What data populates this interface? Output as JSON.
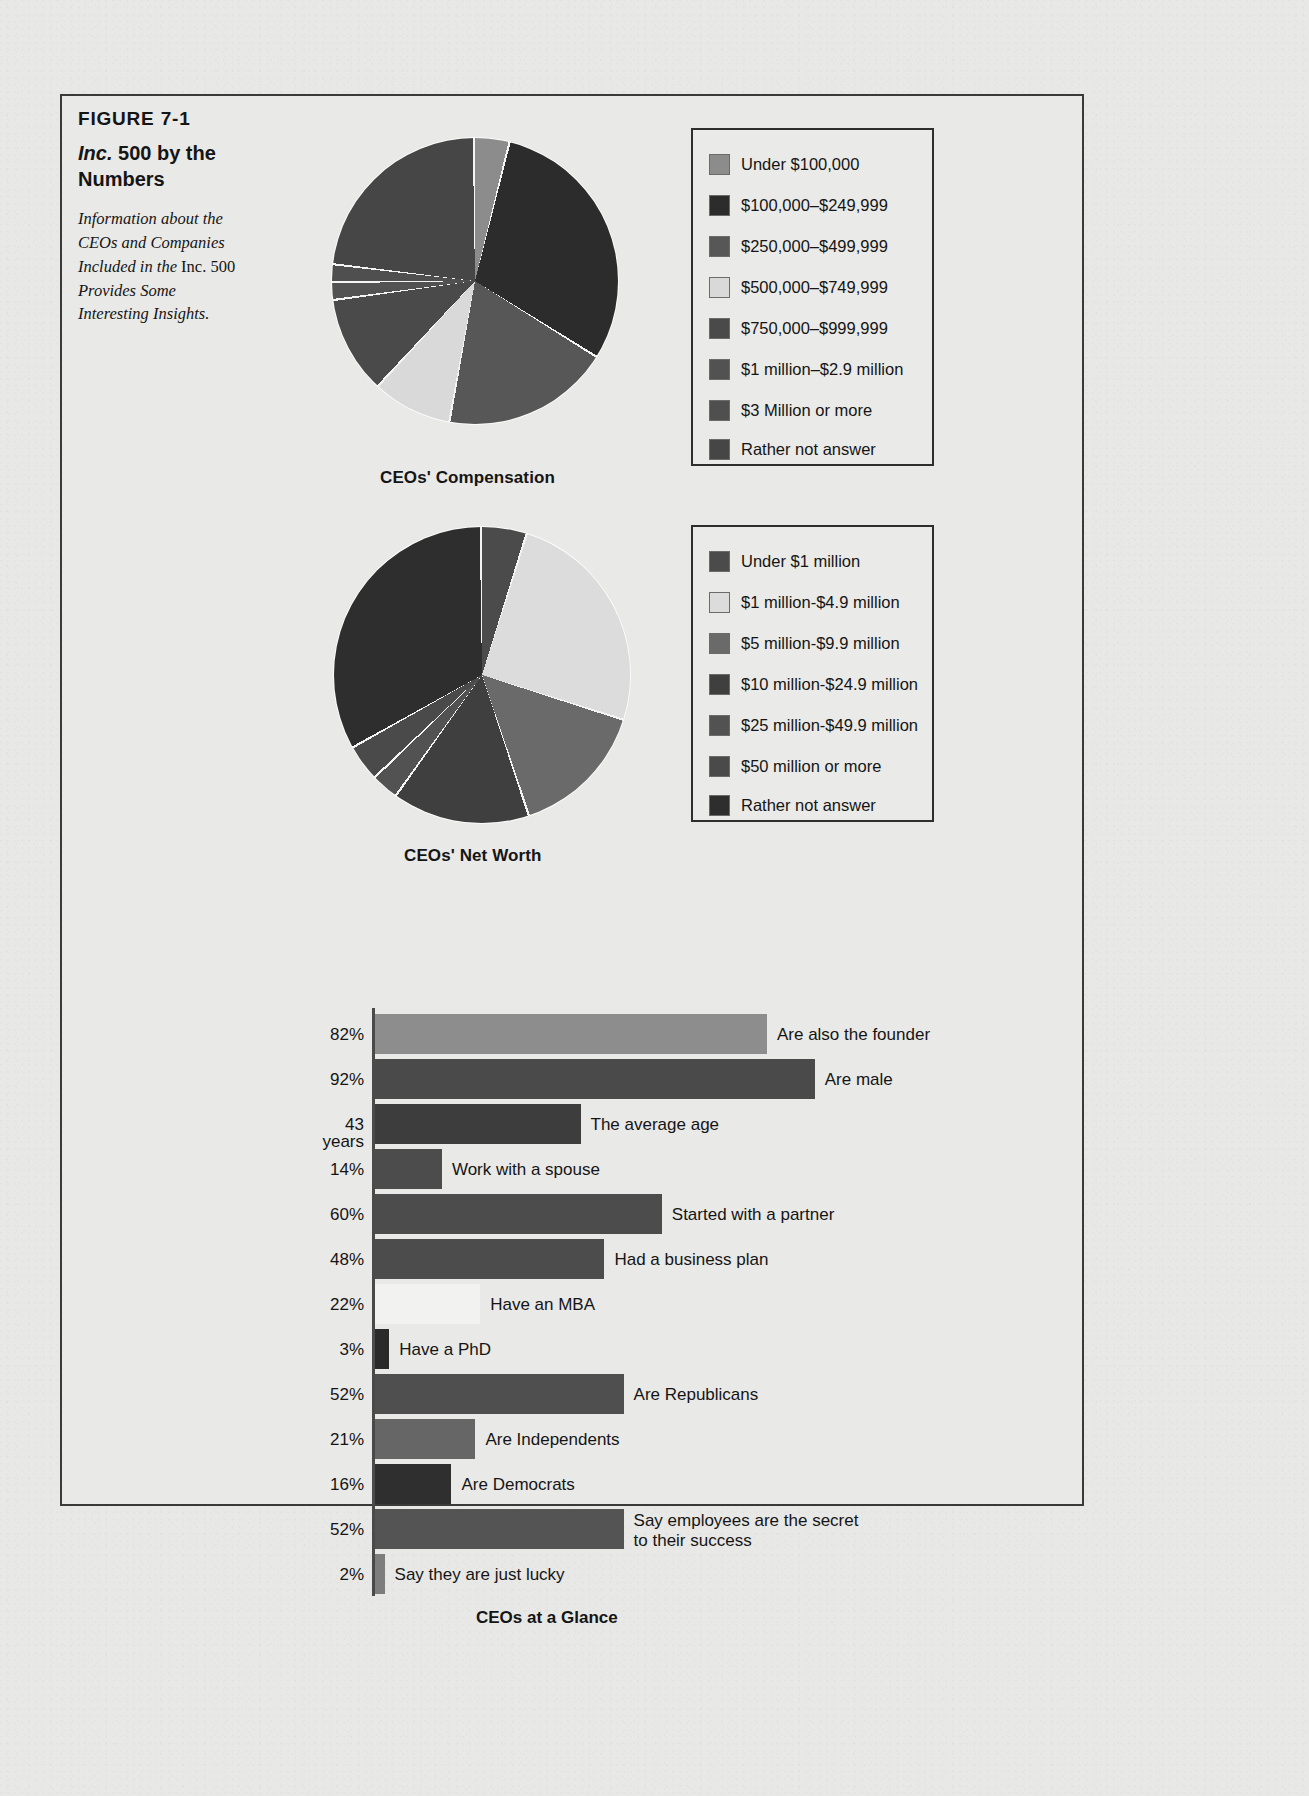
{
  "figure": {
    "number": "FIGURE 7-1",
    "title_italic": "Inc.",
    "title_rest": " 500 by the Numbers",
    "subtitle_line1": "Information about the",
    "subtitle_line2": "CEOs and Companies",
    "subtitle_line3a": "Included in the ",
    "subtitle_line3b": "Inc. 500",
    "subtitle_line4": "Provides Some",
    "subtitle_line5": "Interesting Insights."
  },
  "chart_data": [
    {
      "type": "pie",
      "title": "CEOs' Compensation",
      "legend_position": "right",
      "labels": [
        "Under $100,000",
        "$100,000–$249,999",
        "$250,000–$499,999",
        "$500,000–$749,999",
        "$750,000–$999,999",
        "$1 million–$2.9 million",
        "$3 Million or more",
        "Rather not answer"
      ],
      "values": [
        4,
        30,
        19,
        9,
        11,
        2,
        2,
        23
      ],
      "colors": [
        "#8c8c8c",
        "#2c2c2c",
        "#575757",
        "#d9d9d9",
        "#4a4a4a",
        "#525252",
        "#4f4f4f",
        "#464646"
      ]
    },
    {
      "type": "pie",
      "title": "CEOs' Net Worth",
      "legend_position": "right",
      "labels": [
        "Under $1 million",
        "$1 million-$4.9 million",
        "$5 million-$9.9 million",
        "$10 million-$24.9 million",
        "$25 million-$49.9 million",
        "$50 million or more",
        "Rather not answer"
      ],
      "values": [
        5,
        25,
        15,
        15,
        3,
        4,
        33
      ],
      "colors": [
        "#4b4b4b",
        "#dcdcdc",
        "#6a6a6a",
        "#3f3f3f",
        "#525252",
        "#4a4a4a",
        "#2e2e2e"
      ]
    },
    {
      "type": "bar",
      "orientation": "horizontal",
      "title": "CEOs at a Glance",
      "xlabel": "",
      "ylabel": "",
      "xlim": [
        0,
        100
      ],
      "grid": false,
      "categories": [
        "Are also the founder",
        "Are male",
        "The average age",
        "Work with a spouse",
        "Started with a partner",
        "Had a business plan",
        "Have an MBA",
        "Have a PhD",
        "Are Republicans",
        "Are Independents",
        "Are Democrats",
        "Say employees are the secret\nto their success",
        "Say they are just lucky"
      ],
      "value_labels": [
        "82%",
        "92%",
        "43 years",
        "14%",
        "60%",
        "48%",
        "22%",
        "3%",
        "52%",
        "21%",
        "16%",
        "52%",
        "2%"
      ],
      "values": [
        82,
        92,
        43,
        14,
        60,
        48,
        22,
        3,
        52,
        21,
        16,
        52,
        2
      ],
      "bar_colors": [
        "#8d8d8d",
        "#4a4a4a",
        "#3d3d3d",
        "#4c4c4c",
        "#4c4c4c",
        "#4c4c4c",
        "#f2f2f0",
        "#2a2a2a",
        "#4f4f4f",
        "#666666",
        "#2f2f2f",
        "#545454",
        "#7d7d7d"
      ]
    }
  ]
}
